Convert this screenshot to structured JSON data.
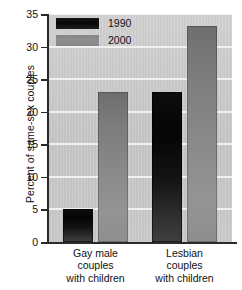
{
  "chart_data": {
    "type": "bar",
    "title": "",
    "subtitle": "",
    "xlabel": "",
    "ylabel": "Percent of same-sex couples",
    "ylim": [
      0,
      35
    ],
    "yticks": [
      0,
      5,
      10,
      15,
      20,
      25,
      30,
      35
    ],
    "ytick_labels": [
      "0",
      "5",
      "10",
      "15",
      "20",
      "25",
      "30",
      "35"
    ],
    "grid": "horizontal",
    "legend_position": "top-left",
    "categories": [
      "Gay male couples with children",
      "Lesbian couples with children"
    ],
    "category_lines": [
      [
        "Gay male",
        "couples",
        "with children"
      ],
      [
        "Lesbian",
        "couples",
        "with children"
      ]
    ],
    "series": [
      {
        "name": "1990",
        "color": "#0d0d0d",
        "values": [
          5.1,
          23.1
        ]
      },
      {
        "name": "2000",
        "color": "#8a8a8a",
        "values": [
          23.1,
          33.1
        ]
      }
    ],
    "annotations": [],
    "plot_background_color": "#cfcfcf",
    "gridline_color": "#f2f2f2",
    "axis_color": "#2b2b2b"
  },
  "legend": {
    "items": [
      {
        "label": "1990",
        "swatch": "legend-swatch-1990"
      },
      {
        "label": "2000",
        "swatch": "legend-swatch-2000"
      }
    ]
  },
  "axis": {
    "y_title": "Percent of same-sex couples"
  }
}
